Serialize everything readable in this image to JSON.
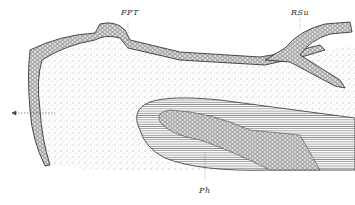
{
  "figure": {
    "type": "histological illustration",
    "labels": [
      {
        "id": "fpt",
        "text": "FPT",
        "x": 121,
        "y": 8
      },
      {
        "id": "rsu",
        "text": "RSu",
        "x": 291,
        "y": 8
      },
      {
        "id": "ph",
        "text": "Ph",
        "x": 199,
        "y": 186
      }
    ],
    "colors": {
      "ink": "#2a2a2a",
      "background": "#ffffff",
      "stipple": "#8a8a8a"
    }
  }
}
